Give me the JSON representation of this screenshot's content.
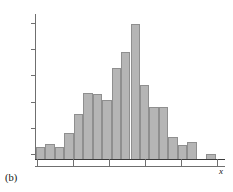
{
  "figure": {
    "panel_label": "(b)",
    "x_axis_label": "x",
    "y_axis_label": "Relative frequency"
  },
  "chart_data": {
    "type": "bar",
    "title": "",
    "subtitle": "",
    "xlabel": "x",
    "ylabel": "Relative frequency",
    "grid": false,
    "legend": null,
    "annotations": [
      "(b)"
    ],
    "x_tick_labels": [],
    "y_tick_labels": [],
    "n_y_ticks": 6,
    "n_x_ticks": 6,
    "ylim": [
      0,
      1
    ],
    "bar_fill_color": "#b5b5b5",
    "bar_edge_color": "#8f8f8f",
    "axis_color": "#6f6f6f",
    "note": "Histogram of relative frequency; 17 contiguous bins plus one isolated bin in the far right tail. Values are bar heights as a fraction of the plotted axis height.",
    "categories": [
      "bin1",
      "bin2",
      "bin3",
      "bin4",
      "bin5",
      "bin6",
      "bin7",
      "bin8",
      "bin9",
      "bin10",
      "bin11",
      "bin12",
      "bin13",
      "bin14",
      "bin15",
      "bin16",
      "bin17",
      "bin18",
      "bin19",
      "bin20"
    ],
    "values": [
      0.085,
      0.105,
      0.08,
      0.18,
      0.31,
      0.455,
      0.45,
      0.41,
      0.63,
      0.735,
      0.93,
      0.51,
      0.36,
      0.36,
      0.15,
      0.1,
      0.12,
      0.0,
      0.0,
      0.035
    ],
    "bars": [
      {
        "index": 1,
        "left_pct": 0.0,
        "width_pct": 5.0,
        "value": 0.085
      },
      {
        "index": 2,
        "left_pct": 5.0,
        "width_pct": 5.0,
        "value": 0.105
      },
      {
        "index": 3,
        "left_pct": 10.0,
        "width_pct": 5.0,
        "value": 0.08
      },
      {
        "index": 4,
        "left_pct": 15.0,
        "width_pct": 5.0,
        "value": 0.18
      },
      {
        "index": 5,
        "left_pct": 20.0,
        "width_pct": 5.0,
        "value": 0.31
      },
      {
        "index": 6,
        "left_pct": 25.0,
        "width_pct": 5.0,
        "value": 0.455
      },
      {
        "index": 7,
        "left_pct": 30.0,
        "width_pct": 5.0,
        "value": 0.45
      },
      {
        "index": 8,
        "left_pct": 35.0,
        "width_pct": 5.0,
        "value": 0.41
      },
      {
        "index": 9,
        "left_pct": 40.0,
        "width_pct": 5.0,
        "value": 0.63
      },
      {
        "index": 10,
        "left_pct": 45.0,
        "width_pct": 5.0,
        "value": 0.735
      },
      {
        "index": 11,
        "left_pct": 50.0,
        "width_pct": 5.0,
        "value": 0.93
      },
      {
        "index": 12,
        "left_pct": 55.0,
        "width_pct": 5.0,
        "value": 0.51
      },
      {
        "index": 13,
        "left_pct": 60.0,
        "width_pct": 5.0,
        "value": 0.36
      },
      {
        "index": 14,
        "left_pct": 65.0,
        "width_pct": 5.0,
        "value": 0.36
      },
      {
        "index": 15,
        "left_pct": 70.0,
        "width_pct": 5.0,
        "value": 0.15
      },
      {
        "index": 16,
        "left_pct": 75.0,
        "width_pct": 5.0,
        "value": 0.1
      },
      {
        "index": 17,
        "left_pct": 80.0,
        "width_pct": 5.0,
        "value": 0.12
      },
      {
        "index": 18,
        "left_pct": 90.0,
        "width_pct": 5.0,
        "value": 0.035
      }
    ],
    "y_ticks_pct": [
      6,
      24,
      42,
      60,
      78,
      96
    ],
    "x_ticks_pct": [
      1,
      20,
      39,
      58,
      77,
      96
    ]
  }
}
